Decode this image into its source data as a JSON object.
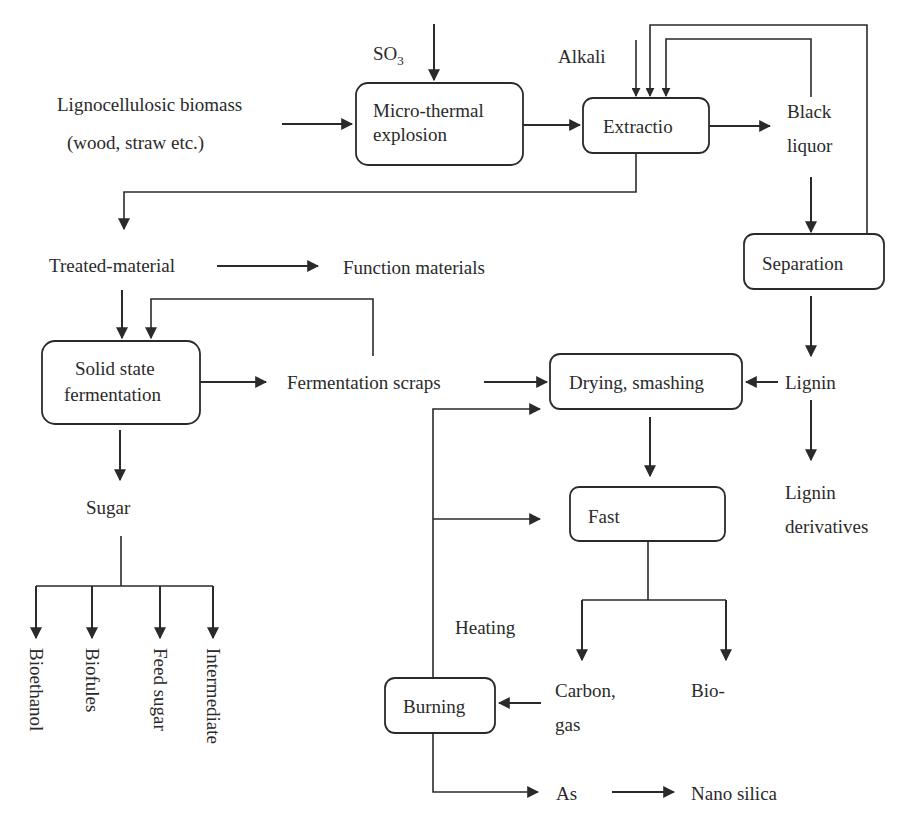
{
  "diagram": {
    "inputs": {
      "biomass_line1": "Lignocellulosic biomass",
      "biomass_line2": "(wood, straw etc.)",
      "so3_base": "SO",
      "so3_sub": "3",
      "alkali": "Alkali"
    },
    "boxes": {
      "micro_thermal_line1": "Micro-thermal",
      "micro_thermal_line2": "explosion",
      "extraction": "Extractio",
      "separation": "Separation",
      "solid_state_line1": "Solid state",
      "solid_state_line2": "fermentation",
      "drying": "Drying, smashing",
      "fast": "Fast",
      "burning": "Burning"
    },
    "nodes": {
      "black_liquor_line1": "Black",
      "black_liquor_line2": "liquor",
      "treated_material": "Treated-material",
      "function_materials": "Function materials",
      "fermentation_scraps": "Fermentation scraps",
      "lignin": "Lignin",
      "lignin_derivatives_line1": "Lignin",
      "lignin_derivatives_line2": "derivatives",
      "sugar": "Sugar",
      "heating": "Heating",
      "carbon_gas_line1": "Carbon,",
      "carbon_gas_line2": "gas",
      "bio": "Bio-",
      "ash": "As",
      "nano_silica": "Nano silica"
    },
    "sugar_products": [
      "Bioethanol",
      "Biofules",
      "Feed sugar",
      "Intermediate"
    ],
    "colors": {
      "stroke": "#2a2a2a",
      "background": "#ffffff"
    }
  }
}
